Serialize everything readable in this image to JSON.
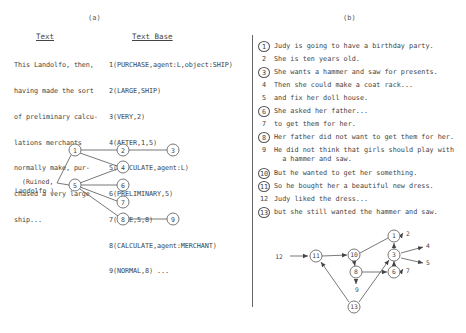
{
  "panel_a": {
    "label": "(a)",
    "text_heading": "Text",
    "text_lines": [
      "This Landolfo, then,",
      "having made the sort",
      "of preliminary calcu-",
      "lations merchants",
      "normally make, pur-",
      "chased a very large",
      "ship..."
    ],
    "textbase_heading": "Text Base",
    "textbase_lines": [
      "1(PURCHASE,agent:L,object:SHIP)",
      "2(LARGE,SHIP)",
      "3(VERY,2)",
      "4(AFTER,1,5)",
      "5(CALCULATE,agent:L)",
      "6(PRELIMINARY,5)",
      "7(LIKE,5,8)",
      "8(CALCULATE,agent:MERCHANT)",
      "9(NORMAL,8) ..."
    ],
    "graph": {
      "root_label_line1": "(Ruined,",
      "root_label_line2": "Landolfo )",
      "nodes": [
        "1",
        "2",
        "3",
        "4",
        "5",
        "6",
        "7",
        "8",
        "9"
      ],
      "edges": [
        [
          "root",
          "1"
        ],
        [
          "root",
          "5"
        ],
        [
          "1",
          "2"
        ],
        [
          "1",
          "4"
        ],
        [
          "2",
          "3"
        ],
        [
          "5",
          "4"
        ],
        [
          "5",
          "6"
        ],
        [
          "5",
          "7"
        ],
        [
          "5",
          "8"
        ],
        [
          "8",
          "9"
        ]
      ]
    }
  },
  "panel_b": {
    "label": "(b)",
    "sentences": [
      {
        "num": "1",
        "circled": true,
        "text": "Judy is going to have a birthday party."
      },
      {
        "num": "2",
        "circled": false,
        "text": "She is ten years old."
      },
      {
        "num": "3",
        "circled": true,
        "text": "She wants a hammer and saw for presents."
      },
      {
        "num": "4",
        "circled": false,
        "text": "Then she could make a coat rack..."
      },
      {
        "num": "5",
        "circled": false,
        "text": "and fix her doll house."
      },
      {
        "num": "6",
        "circled": true,
        "text": "She asked her father..."
      },
      {
        "num": "7",
        "circled": false,
        "text": "to get them for her."
      },
      {
        "num": "8",
        "circled": true,
        "text": "Her father did not want to get them for her."
      },
      {
        "num": "9",
        "circled": false,
        "text": "He did not think that girls should play with",
        "continuation": "  a hammer and saw."
      },
      {
        "num": "10",
        "circled": true,
        "text": "But he wanted to get her something."
      },
      {
        "num": "11",
        "circled": true,
        "text": "So he bought her a beautiful new dress."
      },
      {
        "num": "12",
        "circled": false,
        "text": "Judy liked the dress..."
      },
      {
        "num": "13",
        "circled": true,
        "text": "but she still wanted the hammer and saw."
      }
    ],
    "graph": {
      "circled_nodes": [
        "1",
        "3",
        "6",
        "8",
        "10",
        "11",
        "13"
      ],
      "plain_labels": {
        "n12": "12",
        "n9": "9",
        "n4": "4",
        "n5": "5",
        "n2": "2",
        "n7": "7"
      },
      "edges": [
        [
          "12",
          "11"
        ],
        [
          "11",
          "10"
        ],
        [
          "10",
          "1"
        ],
        [
          "10",
          "8"
        ],
        [
          "8",
          "6"
        ],
        [
          "8",
          "9"
        ],
        [
          "13",
          "11"
        ],
        [
          "13",
          "3"
        ],
        [
          "3",
          "1"
        ],
        [
          "3",
          "4"
        ],
        [
          "3",
          "5"
        ],
        [
          "6",
          "3"
        ],
        [
          "1",
          "2"
        ],
        [
          "6",
          "7"
        ]
      ]
    }
  }
}
